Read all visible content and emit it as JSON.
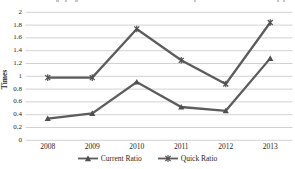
{
  "figure": {
    "ylabel": "Times"
  },
  "chart_data": {
    "type": "line",
    "title": "",
    "xlabel": "",
    "ylabel": "Times",
    "categories": [
      "2008",
      "2009",
      "2010",
      "2011",
      "2012",
      "2013"
    ],
    "series": [
      {
        "name": "Current Ratio",
        "marker": "triangle",
        "values": [
          0.34,
          0.42,
          0.91,
          0.52,
          0.46,
          1.28
        ]
      },
      {
        "name": "Quick Ratio",
        "marker": "star",
        "values": [
          0.98,
          0.98,
          1.74,
          1.25,
          0.88,
          1.84
        ]
      }
    ],
    "ylim": [
      0,
      2
    ],
    "ytick_labels": [
      "0",
      "0.2",
      "0.4",
      "0.6",
      "0.8",
      "1",
      "1.2",
      "1.4",
      "1.6",
      "1.8",
      "2"
    ],
    "grid": "horizontal",
    "legend_position": "bottom",
    "line_color": "#5c5c5c",
    "gridline_color": "#d2d2d2",
    "text_color": "#1f1f1f"
  }
}
